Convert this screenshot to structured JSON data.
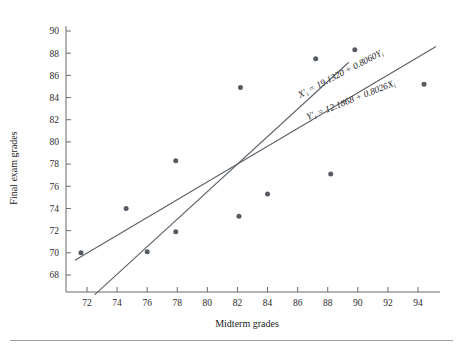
{
  "figure": {
    "background": "#ffffff",
    "point_color": "#555a63",
    "line_color": "#5b6068",
    "axis_color": "#6b6b6b"
  },
  "chart_data": {
    "type": "scatter",
    "title": "",
    "xlabel": "Midterm grades",
    "ylabel": "Final exam grades",
    "xlim": [
      70.5,
      95.5
    ],
    "ylim": [
      66.8,
      91.3
    ],
    "xticks": [
      72,
      74,
      76,
      78,
      80,
      82,
      84,
      86,
      88,
      90,
      92,
      94
    ],
    "xtick_labels": [
      "72",
      "74",
      "76",
      "78",
      "80",
      "82",
      "84",
      "86",
      "88",
      "90",
      "92",
      "94"
    ],
    "yticks": [
      68,
      70,
      72,
      74,
      76,
      78,
      80,
      82,
      84,
      86,
      88,
      90
    ],
    "ytick_labels": [
      "68",
      "70",
      "72",
      "74",
      "76",
      "78",
      "80",
      "82",
      "84",
      "86",
      "88",
      "90"
    ],
    "grid": false,
    "legend": "none",
    "points": [
      {
        "x": 71.6,
        "y": 70.0
      },
      {
        "x": 74.6,
        "y": 74.0
      },
      {
        "x": 76.0,
        "y": 70.1
      },
      {
        "x": 77.9,
        "y": 78.3
      },
      {
        "x": 77.9,
        "y": 71.9
      },
      {
        "x": 82.1,
        "y": 73.3
      },
      {
        "x": 82.2,
        "y": 84.9
      },
      {
        "x": 84.0,
        "y": 75.3
      },
      {
        "x": 87.2,
        "y": 87.5
      },
      {
        "x": 88.2,
        "y": 77.1
      },
      {
        "x": 89.8,
        "y": 88.3
      },
      {
        "x": 94.4,
        "y": 85.2
      }
    ],
    "series": [
      {
        "name": "regression-x-on-y",
        "type": "line",
        "equation_text": "X = 19.1320 + 0.8060Y",
        "label_parts": {
          "lhs_var": "X",
          "lhs_prime": "′",
          "lhs_sub": "i",
          "eq": " = ",
          "intercept": "19.1320",
          "plus": " + ",
          "slope": "0.8060",
          "rhs_var": "Y",
          "rhs_sub": "i"
        },
        "intercept": 19.132,
        "slope": 0.806,
        "orientation": "x-on-y",
        "segment": {
          "x_start": 72.5,
          "x_end": 89.4
        }
      },
      {
        "name": "regression-y-on-x",
        "type": "line",
        "equation_text": "Y = 12.1868 + 0.8026X",
        "label_parts": {
          "lhs_var": "Y",
          "lhs_prime": "′",
          "lhs_sub": "i",
          "eq": " = ",
          "intercept": "12.1868",
          "plus": " + ",
          "slope": "0.8026",
          "rhs_var": "X",
          "rhs_sub": "i"
        },
        "intercept": 12.1868,
        "slope": 0.8026,
        "orientation": "y-on-x",
        "segment": {
          "x_start": 71.2,
          "x_end": 95.2
        }
      }
    ]
  }
}
